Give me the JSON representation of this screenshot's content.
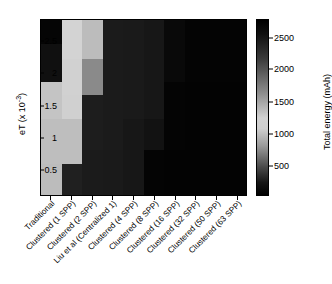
{
  "figure": {
    "background": "#ffffff",
    "plot_border_color": "#000000"
  },
  "yaxis": {
    "label_text": "eT (x 10",
    "label_exponent": "-3",
    "label_suffix": ")",
    "ticks": [
      "2.5",
      "2",
      "1.5",
      "1",
      "0.5"
    ],
    "tick_fractions": [
      0.125,
      0.305,
      0.49,
      0.672,
      0.855
    ]
  },
  "xaxis": {
    "ticks": [
      "Traditional",
      "Clustered (1 SPP)",
      "Clustered (2 SPP)",
      "Liu et al (Centralized 1)",
      "Clustered (4 SPP)",
      "Clustered (8 SPP)",
      "Clustered (16 SPP)",
      "Clustered (32 SPP)",
      "Clustered (50 SPP)",
      "Clustered (63 SPP)"
    ]
  },
  "colorbar": {
    "label": "Total energy (mAh)",
    "ticks": [
      "2500",
      "2000",
      "1500",
      "1000",
      "500"
    ],
    "tick_fractions": [
      0.105,
      0.285,
      0.468,
      0.65,
      0.832
    ],
    "colormap": "gray",
    "vmin": 0,
    "vmax": 2800
  },
  "chart_data": {
    "type": "heatmap",
    "title": "",
    "xlabel": "",
    "ylabel": "eT (x 10^-3)",
    "colorbar_label": "Total energy (mAh)",
    "grid": false,
    "legend_position": "right-colorbar",
    "colormap": "gray",
    "vmin": 0,
    "vmax": 2800,
    "x_categories": [
      "Traditional",
      "Clustered (1 SPP)",
      "Clustered (2 SPP)",
      "Liu et al (Centralized 1)",
      "Clustered (4 SPP)",
      "Clustered (8 SPP)",
      "Clustered (16 SPP)",
      "Clustered (32 SPP)",
      "Clustered (50 SPP)",
      "Clustered (63 SPP)"
    ],
    "y_categories": [
      "2.75",
      "2.5",
      "2.25",
      "2.0",
      "1.75",
      "1.5",
      "1.25",
      "1.0",
      "0.75",
      "0.5",
      "0.25"
    ],
    "y_tick_values": [
      0.5,
      1,
      1.5,
      2,
      2.5
    ],
    "rows": [
      {
        "y": "2.75",
        "height_fraction": 0.135,
        "values": [
          60,
          2320,
          2060,
          300,
          280,
          250,
          95,
          40,
          40,
          40
        ]
      },
      {
        "y": "2.40",
        "height_fraction": 0.085,
        "values": [
          180,
          2320,
          2060,
          300,
          280,
          250,
          95,
          40,
          40,
          40
        ]
      },
      {
        "y": "2.10",
        "height_fraction": 0.135,
        "values": [
          180,
          2300,
          1520,
          300,
          280,
          250,
          95,
          40,
          40,
          40
        ]
      },
      {
        "y": "1.75",
        "height_fraction": 0.075,
        "values": [
          2150,
          2300,
          1520,
          300,
          280,
          250,
          45,
          30,
          30,
          30
        ]
      },
      {
        "y": "1.50",
        "height_fraction": 0.135,
        "values": [
          2150,
          2280,
          320,
          300,
          280,
          250,
          45,
          30,
          30,
          30
        ]
      },
      {
        "y": "1.15",
        "height_fraction": 0.175,
        "values": [
          2090,
          2090,
          320,
          300,
          250,
          195,
          45,
          30,
          30,
          30
        ]
      },
      {
        "y": "0.85",
        "height_fraction": 0.085,
        "values": [
          2090,
          2090,
          300,
          280,
          250,
          40,
          30,
          30,
          30,
          30
        ]
      },
      {
        "y": "0.55",
        "height_fraction": 0.175,
        "values": [
          2060,
          350,
          300,
          280,
          250,
          40,
          30,
          30,
          30,
          30
        ]
      }
    ]
  }
}
